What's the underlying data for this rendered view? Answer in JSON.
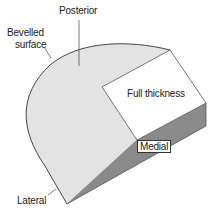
{
  "diagram": {
    "labels": {
      "posterior": "Posterior",
      "bevelled_line1": "Bevelled",
      "bevelled_line2": "surface",
      "full_thickness": "Full thickness",
      "medial": "Medial",
      "lateral": "Lateral"
    },
    "colors": {
      "bevelled_face": "#e3e3e3",
      "top_face": "#ffffff",
      "side_face": "#8a8a8a",
      "outline": "#444444"
    }
  }
}
